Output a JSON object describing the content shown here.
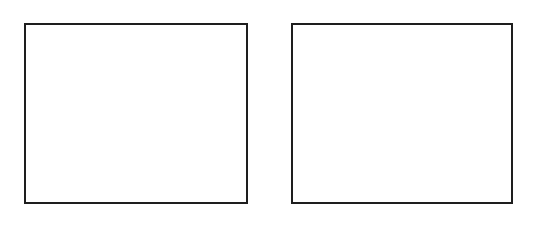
{
  "canvas": {
    "width": 533,
    "height": 221,
    "background": "#ffffff"
  },
  "frames": [
    {
      "id": "frame-1",
      "border_color": "#1e1e1e",
      "border_width": 2,
      "content": ""
    },
    {
      "id": "frame-2",
      "border_color": "#1e1e1e",
      "border_width": 2,
      "content": ""
    }
  ]
}
